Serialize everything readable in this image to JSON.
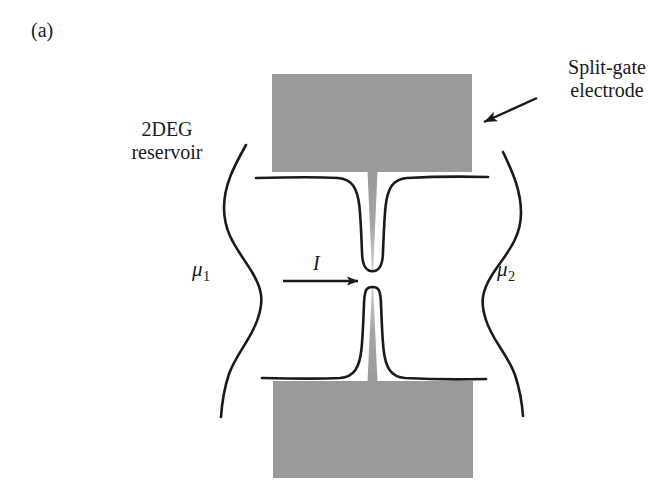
{
  "figure": {
    "panel_label": "(a)",
    "caption_text": "",
    "background_color": "#ffffff",
    "ink_color": "#1a1a1a",
    "gate_fill_color": "#9a9a9a"
  },
  "labels": {
    "reservoir": {
      "line1": "2DEG",
      "line2": "reservoir",
      "name": "2DEG reservoir"
    },
    "split_gate": {
      "line1": "Split-gate",
      "line2": "electrode",
      "name": "Split-gate electrode"
    },
    "mu_left": {
      "symbol": "μ",
      "subscript": "1",
      "name": "mu-1 chemical potential"
    },
    "mu_right": {
      "symbol": "μ",
      "subscript": "2",
      "name": "mu-2 chemical potential"
    },
    "current": {
      "symbol": "I",
      "name": "current I"
    }
  },
  "elements": {
    "gate_top": "top split-gate electrode",
    "gate_bottom": "bottom split-gate electrode",
    "potential_top": "top confining potential contour",
    "potential_bottom": "bottom confining potential contour",
    "reservoir_left": "left 2DEG reservoir boundary",
    "reservoir_right": "right 2DEG reservoir boundary",
    "current_arrow": "current direction arrow",
    "pointer_arrow": "split-gate electrode pointer arrow"
  },
  "colors": {
    "gate_gray": "#9a9a9a",
    "gate_gray_light": "#b3b3b3",
    "line_black": "#1a1a1a",
    "page_white": "#ffffff"
  }
}
